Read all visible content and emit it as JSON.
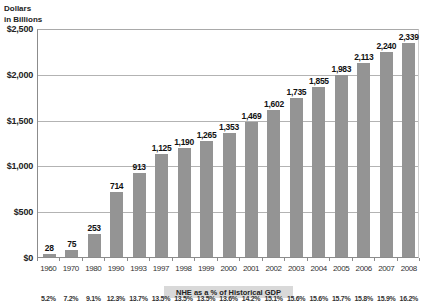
{
  "chart_data": {
    "type": "bar",
    "title": "",
    "y_axis_title_line1": "Dollars",
    "y_axis_title_line2": "in Billions",
    "ylabel": "Dollars in Billions",
    "xlabel": "",
    "ylim": [
      0,
      2500
    ],
    "y_tick_interval": 500,
    "y_tick_labels": [
      "$0",
      "$500",
      "$1,000",
      "$1,500",
      "$2,000",
      "$2,500"
    ],
    "grid": true,
    "legend_position": "none",
    "categories": [
      "1960",
      "1970",
      "1980",
      "1990",
      "1993",
      "1997",
      "1998",
      "1999",
      "2000",
      "2001",
      "2002",
      "2003",
      "2004",
      "2005",
      "2006",
      "2007",
      "2008"
    ],
    "values": [
      28,
      75,
      253,
      714,
      913,
      1125,
      1190,
      1265,
      1353,
      1469,
      1602,
      1735,
      1855,
      1983,
      2113,
      2240,
      2339
    ],
    "value_labels": [
      "28",
      "75",
      "253",
      "714",
      "913",
      "1,125",
      "1,190",
      "1,265",
      "1,353",
      "1,469",
      "1,602",
      "1,735",
      "1,855",
      "1,983",
      "2,113",
      "2,240",
      "2,339"
    ],
    "secondary_title": "NHE as a % of Historical GDP",
    "secondary_values": [
      "5.2%",
      "7.2%",
      "9.1%",
      "12.3%",
      "13.7%",
      "13.5%",
      "13.5%",
      "13.5%",
      "13.6%",
      "14.2%",
      "15.1%",
      "15.6%",
      "15.6%",
      "15.7%",
      "15.8%",
      "15.9%",
      "16.2%"
    ],
    "colors": {
      "bar": "#949494",
      "gridline": "#b3b3b3",
      "axis": "#8c8c8c",
      "banner_background": "#d9d9d9",
      "text": "#1a1a1a",
      "background": "#ffffff"
    }
  }
}
